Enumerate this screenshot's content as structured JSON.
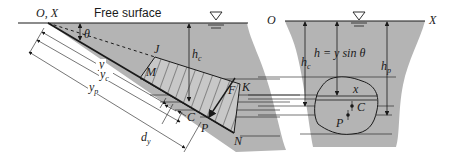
{
  "diagram": {
    "colors": {
      "fluid": "#b4b4b4",
      "ink": "#1a1a1a",
      "background": "#ffffff"
    },
    "left_panel": {
      "origin_label": "O, X",
      "free_surface_label": "Free surface",
      "angle_label": "θ",
      "corner_labels": {
        "J": "J",
        "M": "M",
        "K": "K",
        "N": "N"
      },
      "centroid_label": "C",
      "pressure_center_label": "P",
      "force_label": "F",
      "depth_label": {
        "main": "h",
        "sub": "c"
      },
      "dimension_labels": {
        "y": "y",
        "yc": {
          "main": "y",
          "sub": "c"
        },
        "yp": {
          "main": "y",
          "sub": "p"
        },
        "dy": {
          "main": "d",
          "sub": "y"
        }
      }
    },
    "right_panel": {
      "origin_label": "O",
      "axis_label": "X",
      "hc_label": {
        "main": "h",
        "sub": "c"
      },
      "hp_label": {
        "main": "h",
        "sub": "p"
      },
      "equation": "h = y sin θ",
      "strip_label": "x",
      "centroid_label": "C",
      "pressure_center_label": "P"
    },
    "free_surface_symbol": "▽"
  }
}
